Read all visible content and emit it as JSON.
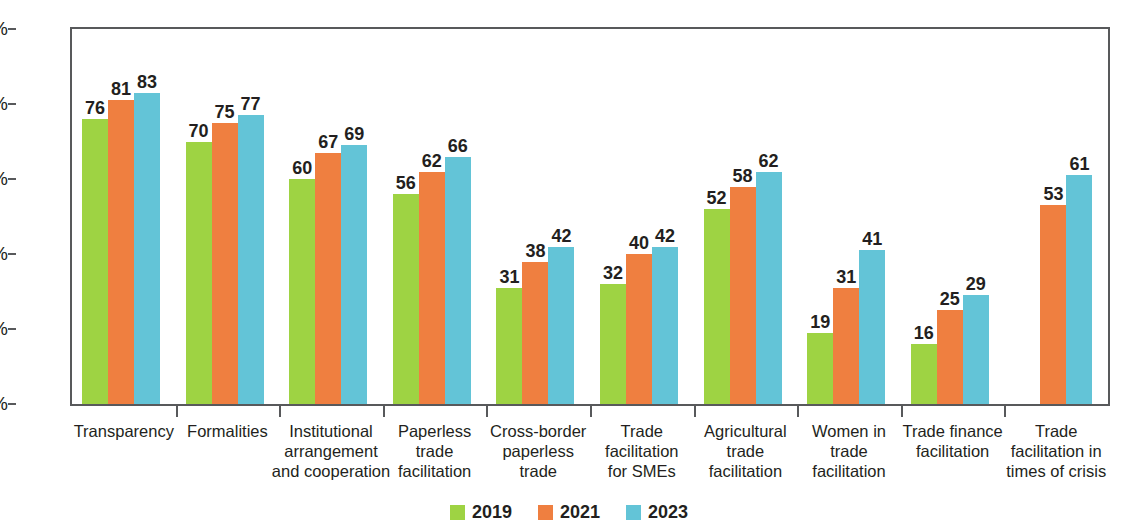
{
  "chart_data": {
    "type": "bar",
    "title": "",
    "subtitle": "",
    "xlabel": "",
    "ylabel": "",
    "ylim": [
      0,
      100
    ],
    "y_ticks": [
      "0%",
      "20%",
      "40%",
      "60%",
      "80%",
      "100%"
    ],
    "y_tick_values": [
      0,
      20,
      40,
      60,
      80,
      100
    ],
    "grid": false,
    "legend_position": "bottom-center",
    "value_labels": true,
    "categories": [
      "Transparency",
      "Formalities",
      "Institutional arrangement and cooperation",
      "Paperless trade facilitation",
      "Cross-border paperless trade",
      "Trade facilitation for SMEs",
      "Agricultural trade facilitation",
      "Women in trade facilitation",
      "Trade finance facilitation",
      "Trade facilitation in times of crisis"
    ],
    "category_label_lines": [
      [
        "Transparency"
      ],
      [
        "Formalities"
      ],
      [
        "Institutional",
        "arrangement",
        "and cooperation"
      ],
      [
        "Paperless",
        "trade",
        "facilitation"
      ],
      [
        "Cross-border",
        "paperless",
        "trade"
      ],
      [
        "Trade",
        "facilitation",
        "for SMEs"
      ],
      [
        "Agricultural",
        "trade",
        "facilitation"
      ],
      [
        "Women in",
        "trade",
        "facilitation"
      ],
      [
        "Trade finance",
        "facilitation"
      ],
      [
        "Trade",
        "facilitation in",
        "times of crisis"
      ]
    ],
    "series": [
      {
        "name": "2019",
        "color": "#9ed343",
        "values": [
          76,
          70,
          60,
          56,
          31,
          32,
          52,
          19,
          16,
          null
        ]
      },
      {
        "name": "2021",
        "color": "#ef7f40",
        "values": [
          81,
          75,
          67,
          62,
          38,
          40,
          58,
          31,
          25,
          53
        ]
      },
      {
        "name": "2023",
        "color": "#63c4d7",
        "values": [
          83,
          77,
          69,
          66,
          42,
          42,
          62,
          41,
          29,
          61
        ]
      }
    ],
    "legend": [
      {
        "label": "2019",
        "color": "#9ed343"
      },
      {
        "label": "2021",
        "color": "#ef7f40"
      },
      {
        "label": "2023",
        "color": "#63c4d7"
      }
    ]
  }
}
